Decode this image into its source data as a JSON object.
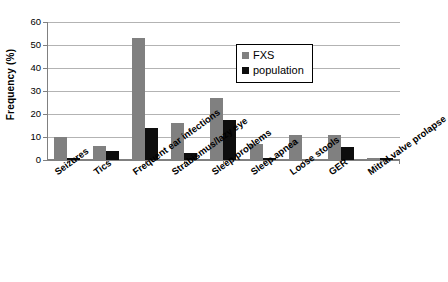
{
  "chart_data": {
    "type": "bar",
    "title": "",
    "xlabel": "",
    "ylabel": "Frequency (%)",
    "ylim": [
      0,
      60
    ],
    "yticks": [
      0,
      10,
      20,
      30,
      40,
      50,
      60
    ],
    "grid": true,
    "legend_position": "top-right",
    "categories": [
      "Seizures",
      "Tics",
      "Frequent ear infections",
      "Strabismus/lazy eye",
      "Sleep problems",
      "Sleep apnea",
      "Loose stools",
      "GER",
      "Mitral valve prolapse"
    ],
    "series": [
      {
        "name": "FXS",
        "color": "#808080",
        "values": [
          10,
          6,
          53,
          16,
          27,
          7,
          11,
          11,
          1
        ]
      },
      {
        "name": "population",
        "color": "#0d0d0d",
        "values": [
          1,
          4,
          14,
          3,
          17.5,
          1,
          null,
          5.5,
          1
        ]
      }
    ]
  }
}
